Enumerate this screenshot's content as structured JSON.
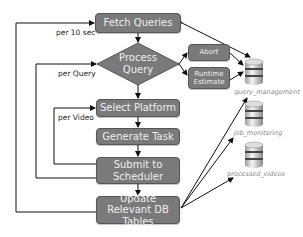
{
  "nodes": {
    "fetch_queries": "Fetch Queries",
    "process_query": "Process Query",
    "abort": "Abort",
    "runtime_estimate": "Runtime Estimate",
    "select_platform": "Select Platform",
    "generate_task": "Generate Task",
    "submit_to_scheduler": "Submit to Scheduler",
    "update_db_tables": "Update Relevant DB Tables"
  },
  "loop_labels": {
    "per_10_sec": "per 10 sec",
    "per_query": "per Query",
    "per_video": "per Video"
  },
  "databases": [
    {
      "name": "query_management"
    },
    {
      "name": "job_monitoring"
    },
    {
      "name": "processed_videos"
    }
  ],
  "colors": {
    "node_fill": "#7a7a7a",
    "node_border": "#555555",
    "node_text": "#eeeeee",
    "db_label": "#888888"
  }
}
